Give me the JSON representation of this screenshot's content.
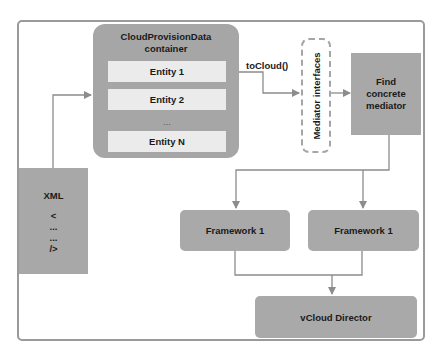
{
  "container": {
    "title_line1": "CloudProvisionData",
    "title_line2": "container",
    "entities": [
      "Entity 1",
      "Entity 2",
      "Entity N"
    ],
    "ellipsis": "..."
  },
  "edge_label": "toCloud()",
  "mediator": {
    "label": "Mediator interfaces"
  },
  "find": {
    "line1": "Find",
    "line2": "concrete",
    "line3": "mediator"
  },
  "xml": {
    "title": "XML",
    "lines": [
      "<",
      "...",
      "...",
      "/>"
    ]
  },
  "frameworks": [
    "Framework 1",
    "Framework 1"
  ],
  "target": {
    "label": "vCloud Director"
  },
  "colors": {
    "box": "#a8a8a8",
    "entity": "#ebebeb",
    "line": "#8c8c8c",
    "border": "#9a9a9a"
  }
}
